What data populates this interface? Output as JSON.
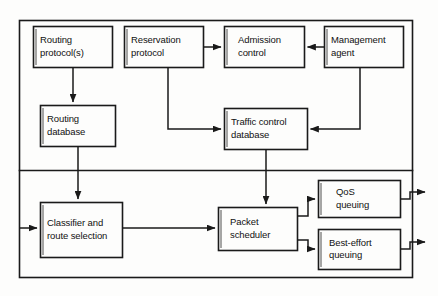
{
  "diagram": {
    "stroke_color": "#1a1a1a",
    "background_color": "#fdfdfc",
    "sections": [
      {
        "name": "control-plane",
        "label": ""
      },
      {
        "name": "forwarding-plane",
        "label": ""
      }
    ],
    "nodes": [
      {
        "id": "routing-protocols",
        "label": "Routing\nprotocol(s)",
        "x": 33,
        "y": 26,
        "w": 79,
        "h": 41
      },
      {
        "id": "reservation-protocol",
        "label": "Reservation\nprotocol",
        "x": 124,
        "y": 26,
        "w": 79,
        "h": 41
      },
      {
        "id": "admission-control",
        "label": "Admission\ncontrol",
        "x": 224,
        "y": 26,
        "w": 80,
        "h": 41
      },
      {
        "id": "management-agent",
        "label": "Management\nagent",
        "x": 324,
        "y": 26,
        "w": 79,
        "h": 41
      },
      {
        "id": "routing-database",
        "label": "Routing\ndatabase",
        "x": 40,
        "y": 105,
        "w": 75,
        "h": 41
      },
      {
        "id": "traffic-control-database",
        "label": "Traffic control\ndatabase",
        "x": 224,
        "y": 108,
        "w": 83,
        "h": 41
      },
      {
        "id": "classifier-and-route-selection",
        "label": "Classifier and\nroute selection",
        "x": 40,
        "y": 202,
        "w": 82,
        "h": 55
      },
      {
        "id": "packet-scheduler",
        "label": "Packet\nscheduler",
        "x": 218,
        "y": 207,
        "w": 79,
        "h": 43
      },
      {
        "id": "qos-queuing",
        "label": "QoS\nqueuing",
        "x": 318,
        "y": 180,
        "w": 82,
        "h": 37
      },
      {
        "id": "best-effort-queuing",
        "label": "Best-effort\nqueuing",
        "x": 318,
        "y": 229,
        "w": 82,
        "h": 40
      }
    ],
    "edges": [
      {
        "from": "routing-protocols",
        "to": "routing-database"
      },
      {
        "from": "reservation-protocol",
        "to": "admission-control"
      },
      {
        "from": "management-agent",
        "to": "admission-control"
      },
      {
        "from": "reservation-protocol",
        "to": "traffic-control-database"
      },
      {
        "from": "management-agent",
        "to": "traffic-control-database"
      },
      {
        "from": "routing-database",
        "to": "classifier-and-route-selection"
      },
      {
        "from": "traffic-control-database",
        "to": "packet-scheduler"
      },
      {
        "from": "packet-input",
        "to": "classifier-and-route-selection"
      },
      {
        "from": "classifier-and-route-selection",
        "to": "packet-scheduler"
      },
      {
        "from": "packet-scheduler",
        "to": "qos-queuing"
      },
      {
        "from": "packet-scheduler",
        "to": "best-effort-queuing"
      },
      {
        "from": "qos-queuing",
        "to": "qos-output"
      },
      {
        "from": "best-effort-queuing",
        "to": "best-effort-output"
      }
    ]
  }
}
